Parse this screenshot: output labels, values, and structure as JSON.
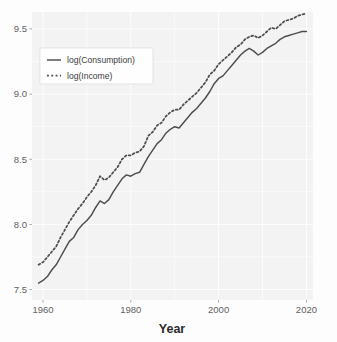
{
  "chart_data": {
    "type": "line",
    "title": "",
    "subtitle": "",
    "xlabel": "Year",
    "ylabel": "",
    "xlim": [
      1957.5,
      2021.5
    ],
    "ylim": [
      7.42,
      9.63
    ],
    "xticks": [
      1960,
      1980,
      2000,
      2020
    ],
    "yticks": [
      7.5,
      8.0,
      8.5,
      9.0,
      9.5
    ],
    "xtick_labels": [
      "1960",
      "1980",
      "2000",
      "2020"
    ],
    "ytick_labels": [
      "7.5",
      "8.0",
      "8.5",
      "9.0",
      "9.5"
    ],
    "grid": true,
    "grid_color": "#ffffff",
    "panel_background": "#ebebeb",
    "legend": {
      "position": "top-left-inside",
      "entries": [
        {
          "label": "log(Consumption)",
          "style": "solid",
          "color": "#4d4d4d"
        },
        {
          "label": "log(Income)",
          "style": "dotted",
          "color": "#4d4d4d"
        }
      ]
    },
    "x": [
      1959,
      1960,
      1961,
      1962,
      1963,
      1964,
      1965,
      1966,
      1967,
      1968,
      1969,
      1970,
      1971,
      1972,
      1973,
      1974,
      1975,
      1976,
      1977,
      1978,
      1979,
      1980,
      1981,
      1982,
      1983,
      1984,
      1985,
      1986,
      1987,
      1988,
      1989,
      1990,
      1991,
      1992,
      1993,
      1994,
      1995,
      1996,
      1997,
      1998,
      1999,
      2000,
      2001,
      2002,
      2003,
      2004,
      2005,
      2006,
      2007,
      2008,
      2009,
      2010,
      2011,
      2012,
      2013,
      2014,
      2015,
      2016,
      2017,
      2018,
      2019,
      2020
    ],
    "series": [
      {
        "name": "log(Consumption)",
        "style": "solid",
        "color": "#4d4d4d",
        "values": [
          7.55,
          7.57,
          7.6,
          7.65,
          7.69,
          7.75,
          7.81,
          7.87,
          7.9,
          7.96,
          8.0,
          8.03,
          8.07,
          8.13,
          8.18,
          8.16,
          8.19,
          8.25,
          8.3,
          8.35,
          8.38,
          8.37,
          8.39,
          8.4,
          8.46,
          8.52,
          8.57,
          8.62,
          8.65,
          8.7,
          8.73,
          8.75,
          8.74,
          8.78,
          8.82,
          8.86,
          8.89,
          8.93,
          8.97,
          9.02,
          9.08,
          9.12,
          9.14,
          9.18,
          9.22,
          9.26,
          9.3,
          9.33,
          9.35,
          9.33,
          9.3,
          9.32,
          9.35,
          9.37,
          9.39,
          9.42,
          9.44,
          9.45,
          9.46,
          9.47,
          9.48,
          9.48
        ]
      },
      {
        "name": "log(Income)",
        "style": "dotted",
        "color": "#4d4d4d",
        "values": [
          7.69,
          7.71,
          7.75,
          7.79,
          7.83,
          7.9,
          7.96,
          8.02,
          8.07,
          8.12,
          8.16,
          8.21,
          8.25,
          8.3,
          8.37,
          8.34,
          8.36,
          8.4,
          8.44,
          8.5,
          8.53,
          8.53,
          8.55,
          8.56,
          8.6,
          8.68,
          8.71,
          8.76,
          8.78,
          8.83,
          8.86,
          8.88,
          8.88,
          8.92,
          8.95,
          8.98,
          9.01,
          9.05,
          9.09,
          9.15,
          9.18,
          9.23,
          9.26,
          9.29,
          9.32,
          9.36,
          9.38,
          9.42,
          9.44,
          9.45,
          9.43,
          9.45,
          9.48,
          9.51,
          9.5,
          9.53,
          9.56,
          9.57,
          9.58,
          9.6,
          9.61,
          9.62
        ]
      }
    ]
  },
  "axis": {
    "x_title": "Year"
  }
}
